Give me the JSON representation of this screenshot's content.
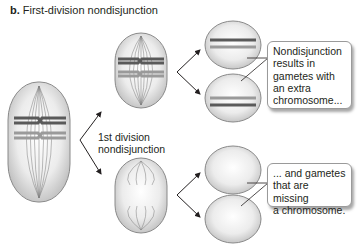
{
  "figure": {
    "panel_letter": "b.",
    "title": "First-division nondisjunction"
  },
  "labels": {
    "division_line1": "1st division",
    "division_line2": "nondisjunction"
  },
  "callouts": {
    "extra": {
      "lines": [
        "Nondisjunction",
        "results in",
        "gametes with",
        "an extra",
        "chromosome..."
      ]
    },
    "missing": {
      "lines": [
        "... and gametes",
        "that are missing",
        "a chromosome."
      ]
    }
  },
  "colors": {
    "cell_fill": "#d9d9d9",
    "cell_stroke": "#8a8a8a",
    "chromosome_dark": "#5a5a5a",
    "chromosome_light": "#9a9a9a",
    "arrow": "#231f20"
  },
  "cells": [
    {
      "name": "parent-cell",
      "stage": "metaphase I"
    },
    {
      "name": "daughter-cell-with-chromosomes",
      "stage": "metaphase II"
    },
    {
      "name": "daughter-cell-empty",
      "stage": "metaphase II"
    },
    {
      "name": "gamete-extra-1"
    },
    {
      "name": "gamete-extra-2"
    },
    {
      "name": "gamete-missing-1"
    },
    {
      "name": "gamete-missing-2"
    }
  ]
}
